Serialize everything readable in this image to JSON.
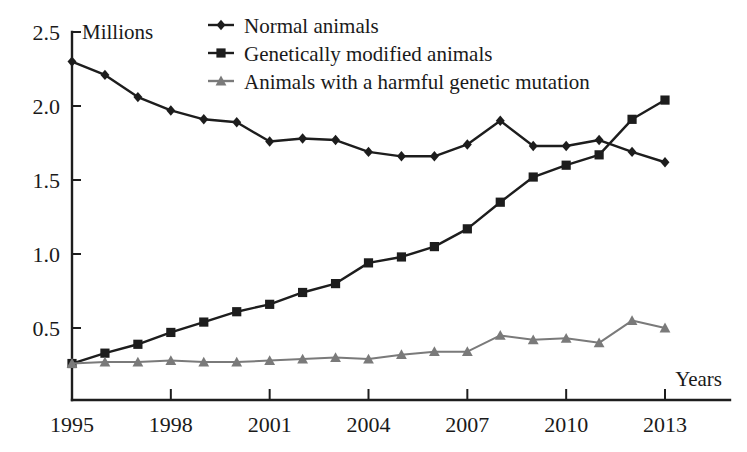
{
  "chart_data": {
    "type": "line",
    "title": "",
    "xlabel": "Years",
    "ylabel": "Millions",
    "x": [
      1995,
      1996,
      1997,
      1998,
      1999,
      2000,
      2001,
      2002,
      2003,
      2004,
      2005,
      2006,
      2007,
      2008,
      2009,
      2010,
      2011,
      2012,
      2013
    ],
    "xticks": [
      1995,
      1998,
      2001,
      2004,
      2007,
      2010,
      2013
    ],
    "xticklabels": [
      "1995",
      "1998",
      "2001",
      "2004",
      "2007",
      "2010",
      "2013"
    ],
    "yticks": [
      0.5,
      1.0,
      1.5,
      2.0,
      2.5
    ],
    "yticklabels": [
      "0.5",
      "1.0",
      "1.5",
      "2.0",
      "2.5"
    ],
    "xlim": [
      1995,
      2013.6
    ],
    "ylim": [
      0.0,
      2.56
    ],
    "grid": false,
    "legend_position": "top-center",
    "series": [
      {
        "name": "Normal animals",
        "marker": "diamond",
        "color": "#1d1d1d",
        "values": [
          2.3,
          2.21,
          2.06,
          1.97,
          1.91,
          1.89,
          1.76,
          1.78,
          1.77,
          1.69,
          1.66,
          1.66,
          1.74,
          1.9,
          1.73,
          1.73,
          1.77,
          1.69,
          1.62
        ]
      },
      {
        "name": "Genetically modified animals",
        "marker": "square",
        "color": "#1d1d1d",
        "values": [
          0.26,
          0.33,
          0.39,
          0.47,
          0.54,
          0.61,
          0.66,
          0.74,
          0.8,
          0.94,
          0.98,
          1.05,
          1.17,
          1.35,
          1.52,
          1.6,
          1.67,
          1.91,
          2.04
        ]
      },
      {
        "name": "Animals with a harmful genetic mutation",
        "marker": "triangle",
        "color": "#7a7a7a",
        "values": [
          0.26,
          0.27,
          0.27,
          0.28,
          0.27,
          0.27,
          0.28,
          0.29,
          0.3,
          0.29,
          0.32,
          0.34,
          0.34,
          0.45,
          0.42,
          0.43,
          0.4,
          0.55,
          0.5
        ]
      }
    ]
  },
  "legend": {
    "items": [
      {
        "label": "Normal animals"
      },
      {
        "label": "Genetically modified animals"
      },
      {
        "label": "Animals with a harmful genetic mutation"
      }
    ]
  }
}
